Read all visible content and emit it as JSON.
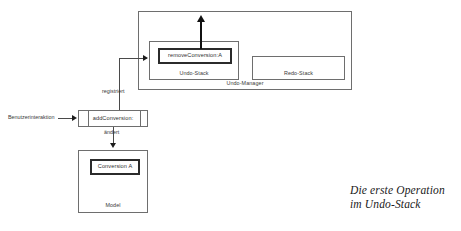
{
  "diagram": {
    "undo_manager": {
      "label": "Undo-Manager",
      "undo_stack": {
        "label": "Undo-Stack",
        "operation": "removeConversion:A"
      },
      "redo_stack": {
        "label": "Redo-Stack"
      }
    },
    "add_conversion": {
      "label": "addConversion:"
    },
    "model": {
      "label": "Model",
      "item": "Conversion A"
    },
    "edges": {
      "user_interaction": "Benutzerinteraktion",
      "registers": "registriert",
      "changes": "ändert"
    }
  },
  "caption": {
    "line1": "Die erste Operation",
    "line2": "im Undo-Stack"
  },
  "colors": {
    "background": "#ffffff",
    "box_border": "#6e6e6e",
    "box_border_strong": "#2b2b2b",
    "line": "#4a4a4a",
    "arrow": "#111111",
    "text": "#2f2f2f",
    "caption_text": "#1a1a1a"
  }
}
